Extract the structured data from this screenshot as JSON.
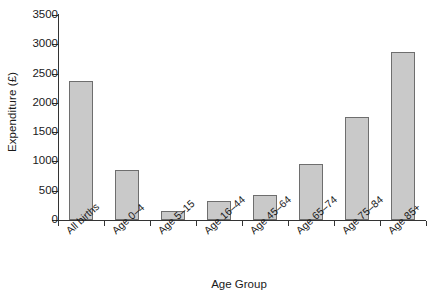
{
  "chart_data": {
    "type": "bar",
    "title": "",
    "xlabel": "Age Group",
    "ylabel": "Expenditure (£)",
    "categories": [
      "All births",
      "Age 0–4",
      "Age 5–15",
      "Age 16–44",
      "Age 45–64",
      "Age 65–74",
      "Age 75–84",
      "Age 85+"
    ],
    "values": [
      2380,
      860,
      150,
      320,
      430,
      960,
      1760,
      2870
    ],
    "ylim": [
      0,
      3500
    ],
    "yticks": [
      0,
      500,
      1000,
      1500,
      2000,
      2500,
      3000,
      3500
    ],
    "ytick_labels": [
      "0",
      "500",
      "1000",
      "1500",
      "2000",
      "2500",
      "3000",
      "3500"
    ],
    "grid": false,
    "legend": false,
    "bar_fill_color": "#c9c9c9",
    "bar_edge_color": "#6e6e6e",
    "axis_color": "#333333"
  }
}
